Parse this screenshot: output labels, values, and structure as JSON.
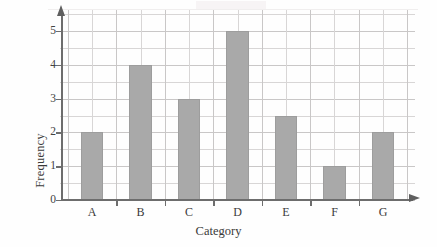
{
  "chart_data": {
    "type": "bar",
    "title": "",
    "xlabel": "Category",
    "ylabel": "Frequency",
    "categories": [
      "A",
      "B",
      "C",
      "D",
      "E",
      "F",
      "G"
    ],
    "values": [
      2,
      4,
      3,
      5,
      2.5,
      1,
      2
    ],
    "ylim": [
      0,
      5
    ],
    "ytick_labels": [
      "0",
      "1",
      "2",
      "3",
      "4",
      "5"
    ],
    "ytick_values": [
      0,
      1,
      2,
      3,
      4,
      5
    ],
    "grid": "both-axes-light-gray-half-unit-spacing",
    "legend": "none",
    "bar_color": "#a9a9a9",
    "grid_color": "#d8d6d6",
    "axis_color": "#6d6d6d",
    "axis_style": "arrow-tipped-x-and-y-axes",
    "xtick_position": "between-categories",
    "annotations": []
  }
}
